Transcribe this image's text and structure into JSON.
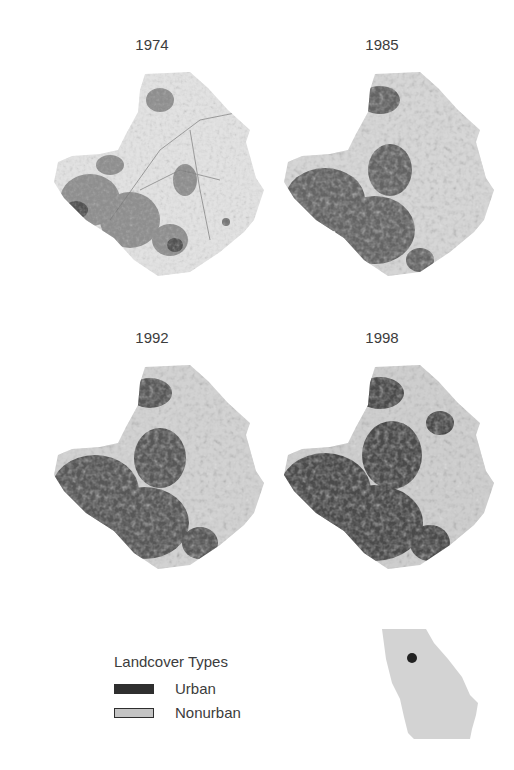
{
  "panels": [
    {
      "year": "1974",
      "urban_density": 0.25
    },
    {
      "year": "1985",
      "urban_density": 0.55
    },
    {
      "year": "1992",
      "urban_density": 0.65
    },
    {
      "year": "1998",
      "urban_density": 0.72
    }
  ],
  "legend": {
    "title": "Landcover Types",
    "items": [
      {
        "label": "Urban",
        "color": "#2f2f2f"
      },
      {
        "label": "Nonurban",
        "color": "#c4c4c4"
      }
    ]
  },
  "inset": {
    "name": "Georgia locator map",
    "fill": "#d3d3d3",
    "marker_color": "#222222"
  },
  "colors": {
    "urban": "#2f2f2f",
    "nonurban": "#dcdcdc",
    "text": "#3c3c3c"
  }
}
